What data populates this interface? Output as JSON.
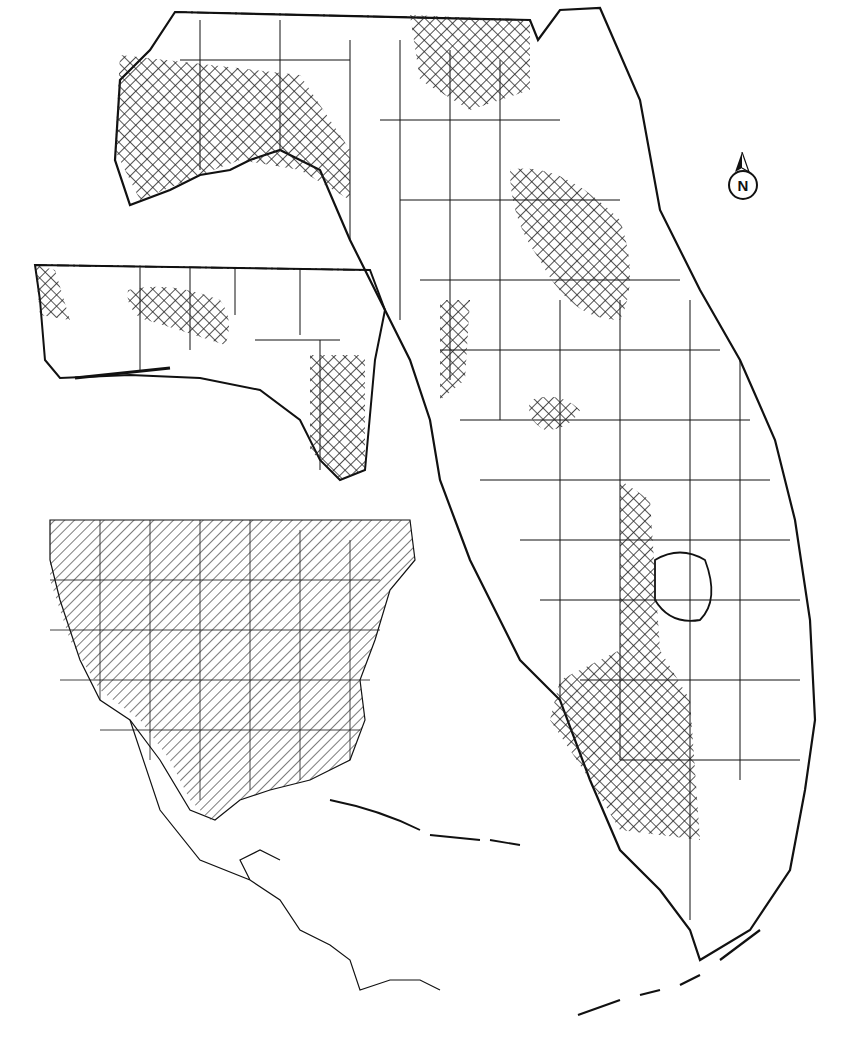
{
  "map": {
    "north_arrow": {
      "label": "N"
    },
    "colors": {
      "outline": "#111111",
      "background": "#ffffff",
      "range_hatch": "#222222"
    },
    "panels": [
      {
        "name": "florida-main",
        "description": "Florida counties with cross-hatched range areas"
      },
      {
        "name": "panhandle-inset",
        "description": "Western panhandle inset with cross-hatched range"
      },
      {
        "name": "north-america-inset",
        "description": "US/Mexico/Caribbean with diagonal-hatched range"
      }
    ]
  }
}
